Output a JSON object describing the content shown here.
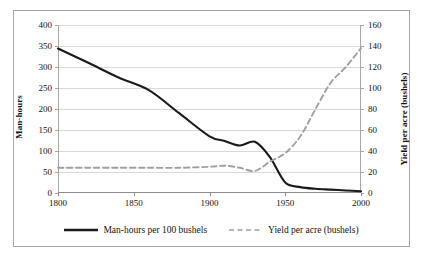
{
  "chart_data": {
    "type": "line",
    "title": "",
    "xlabel": "",
    "x_ticks": [
      1800,
      1850,
      1900,
      1950,
      2000
    ],
    "xlim": [
      1800,
      2000
    ],
    "grid": true,
    "legend_position": "bottom",
    "axes": {
      "left": {
        "label": "Man-hours",
        "ylim": [
          0,
          400
        ],
        "ticks": [
          0,
          50,
          100,
          150,
          200,
          250,
          300,
          350,
          400
        ]
      },
      "right": {
        "label": "Yield per acre (bushels)",
        "ylim": [
          0,
          160
        ],
        "ticks": [
          0,
          20,
          40,
          60,
          80,
          100,
          120,
          140,
          160
        ]
      }
    },
    "series": [
      {
        "name": "Man-hours per 100 bushels",
        "axis": "left",
        "style": "solid",
        "color": "#1a1a1a",
        "x": [
          1800,
          1820,
          1840,
          1860,
          1880,
          1900,
          1910,
          1920,
          1930,
          1940,
          1950,
          1960,
          1970,
          1980,
          1990,
          2000
        ],
        "values": [
          344,
          310,
          275,
          245,
          190,
          135,
          124,
          113,
          122,
          85,
          25,
          14,
          10,
          8,
          6,
          4
        ]
      },
      {
        "name": "Yield per acre (bushels)",
        "axis": "right",
        "style": "dashed",
        "color": "#a0a0a0",
        "x": [
          1800,
          1820,
          1840,
          1860,
          1880,
          1900,
          1910,
          1920,
          1930,
          1940,
          1950,
          1960,
          1970,
          1980,
          1990,
          2000
        ],
        "values": [
          24,
          24,
          24,
          24,
          24,
          25,
          26,
          24,
          21,
          30,
          38,
          54,
          80,
          105,
          120,
          138
        ]
      }
    ]
  },
  "legend": {
    "items": [
      {
        "label": "Man-hours per 100 bushels",
        "style": "solid",
        "color": "#1a1a1a"
      },
      {
        "label": "Yield per acre (bushels)",
        "style": "dashed",
        "color": "#a0a0a0"
      }
    ]
  }
}
